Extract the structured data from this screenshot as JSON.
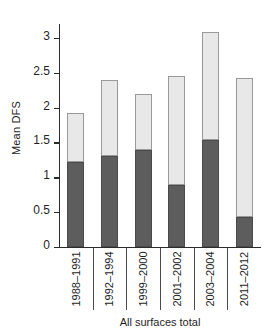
{
  "chart_data": {
    "type": "bar",
    "stacked": true,
    "title": "",
    "xlabel": "All surfaces total",
    "ylabel": "Mean DFS",
    "categories": [
      "1988–1991",
      "1992–1994",
      "1999–2000",
      "2001–2002",
      "2003–2004",
      "2011–2012"
    ],
    "series": [
      {
        "name": "lower-segment",
        "color": "#5d5d5d",
        "values": [
          1.22,
          1.31,
          1.39,
          0.89,
          1.53,
          0.43
        ]
      },
      {
        "name": "upper-segment",
        "color": "#e8e8e8",
        "values": [
          0.7,
          1.08,
          0.81,
          1.56,
          1.56,
          2.0
        ]
      }
    ],
    "totals": [
      1.92,
      2.39,
      2.2,
      2.45,
      3.09,
      2.43
    ],
    "ylim": [
      0,
      3.2
    ],
    "yticks": [
      0,
      0.5,
      1,
      1.5,
      2,
      2.5,
      3
    ],
    "ytick_labels": [
      "0",
      "0.5",
      "1",
      "1.5",
      "2",
      "2.5",
      "3"
    ],
    "grid": false,
    "legend": "none"
  },
  "axes": {
    "y_title": "Mean DFS",
    "x_title": "All surfaces total"
  }
}
